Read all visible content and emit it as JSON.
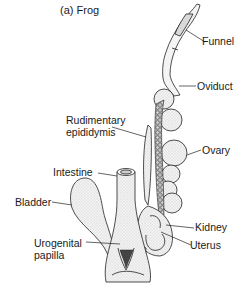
{
  "figure": {
    "title": "(a) Frog",
    "labels": {
      "funnel": "Funnel",
      "oviduct": "Oviduct",
      "rudimentary_epididymis_line1": "Rudimentary",
      "rudimentary_epididymis_line2": "epididymis",
      "ovary": "Ovary",
      "intestine": "Intestine",
      "bladder": "Bladder",
      "kidney": "Kidney",
      "urogenital_papilla_line1": "Urogenital",
      "urogenital_papilla_line2": "papilla",
      "uterus": "Uterus"
    },
    "colors": {
      "ink": "#1a1a1a",
      "fill": "#e6e6e6",
      "stipple": "#bdbdbd",
      "background": "#ffffff"
    }
  }
}
